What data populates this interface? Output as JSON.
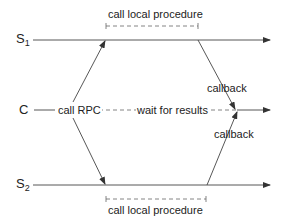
{
  "diagram": {
    "title": "",
    "nodes": {
      "s1": {
        "label": "S",
        "sub": "1"
      },
      "c": {
        "label": "C"
      },
      "s2": {
        "label": "S",
        "sub": "2"
      }
    },
    "labels": {
      "top_procedure": "call local procedure",
      "bottom_procedure": "call local procedure",
      "call_rpc": "call RPC",
      "wait": "wait for results",
      "callback_top": "callback",
      "callback_bottom": "callback"
    },
    "colors": {
      "line": "#333333",
      "text": "#222222",
      "background": "#ffffff"
    }
  }
}
